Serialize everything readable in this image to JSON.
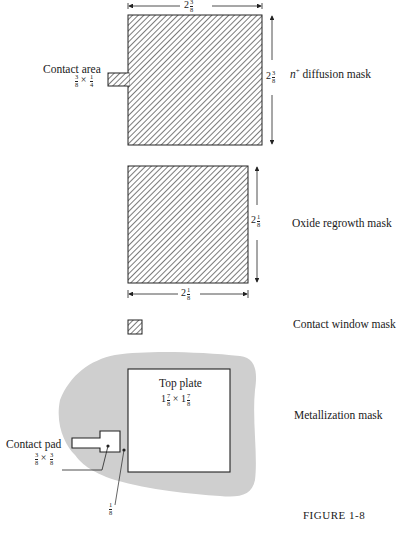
{
  "figure": {
    "caption": "FIGURE 1-8",
    "masks": [
      {
        "name": "n+ diffusion mask",
        "label_prefix": "n",
        "label_sup": "+",
        "label_rest": " diffusion mask",
        "width_dim": {
          "whole": "2",
          "num": "3",
          "den": "8"
        },
        "height_dim": {
          "whole": "2",
          "num": "3",
          "den": "8"
        },
        "contact_area": {
          "label": "Contact area",
          "dims": {
            "a_num": "3",
            "a_den": "8",
            "times": "×",
            "b_num": "1",
            "b_den": "4"
          }
        }
      },
      {
        "name": "Oxide regrowth mask",
        "label": "Oxide regrowth mask",
        "width_dim": {
          "whole": "2",
          "num": "1",
          "den": "8"
        },
        "height_dim": {
          "whole": "2",
          "num": "1",
          "den": "8"
        }
      },
      {
        "name": "Contact window mask",
        "label": "Contact window mask"
      },
      {
        "name": "Metallization mask",
        "label": "Metallization mask",
        "top_plate": {
          "label": "Top plate",
          "dims": {
            "a_whole": "1",
            "a_num": "7",
            "a_den": "8",
            "times": "×",
            "b_whole": "1",
            "b_num": "7",
            "b_den": "8"
          }
        },
        "contact_pad": {
          "label": "Contact pad",
          "dims": {
            "a_num": "3",
            "a_den": "8",
            "times": "×",
            "b_num": "3",
            "b_den": "8"
          }
        },
        "gap_dim": {
          "num": "1",
          "den": "8"
        }
      }
    ]
  }
}
